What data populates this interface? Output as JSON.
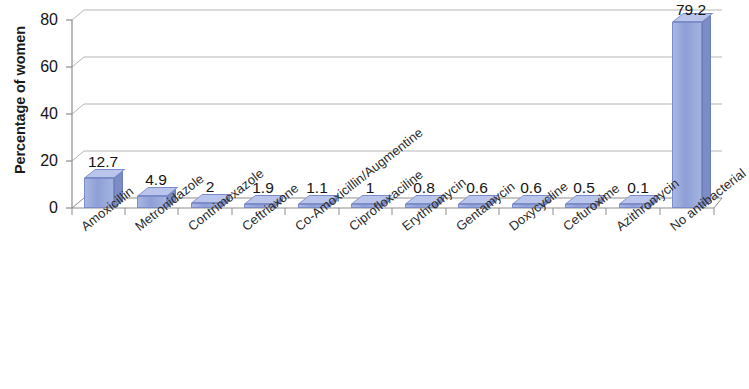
{
  "chart_data": {
    "type": "bar",
    "title": "",
    "xlabel": "",
    "ylabel": "Percentage of women",
    "ylim": [
      0,
      80
    ],
    "yticks": [
      0,
      20,
      40,
      60,
      80
    ],
    "grid": true,
    "legend": "none",
    "style": "3d-column",
    "bar_color": "#8e9fd6",
    "bar_side_color": "#7b8cc6",
    "bar_top_color": "#b9c5ea",
    "categories": [
      "Amoxicillin",
      "Metronidazole",
      "Contrimoxazole",
      "Ceftriaxone",
      "Co-Amoxicillin/Augmentine",
      "Ciprofloxaciline",
      "Erythromycin",
      "Gentamycin",
      "Doxycycline",
      "Cefuroxime",
      "Azithromycin",
      "No antibacterial"
    ],
    "values": [
      12.7,
      4.9,
      2,
      1.9,
      1.1,
      1,
      0.8,
      0.6,
      0.6,
      0.5,
      0.1,
      79.2
    ],
    "value_labels": [
      "12.7",
      "4.9",
      "2",
      "1.9",
      "1.1",
      "1",
      "0.8",
      "0.6",
      "0.6",
      "0.5",
      "0.1",
      "79.2"
    ]
  },
  "axis": {
    "y_title": "Percentage of women",
    "y_tick_labels": [
      "0",
      "20",
      "40",
      "60",
      "80"
    ]
  }
}
